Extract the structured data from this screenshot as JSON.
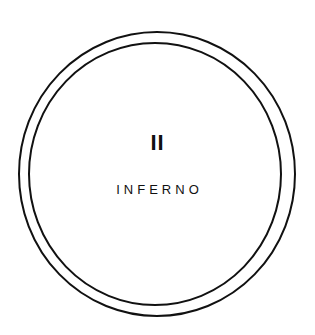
{
  "cover": {
    "numeral": "II",
    "title": "INFERNO",
    "colors": {
      "background": "#ffffff",
      "ink": "#111111"
    }
  }
}
